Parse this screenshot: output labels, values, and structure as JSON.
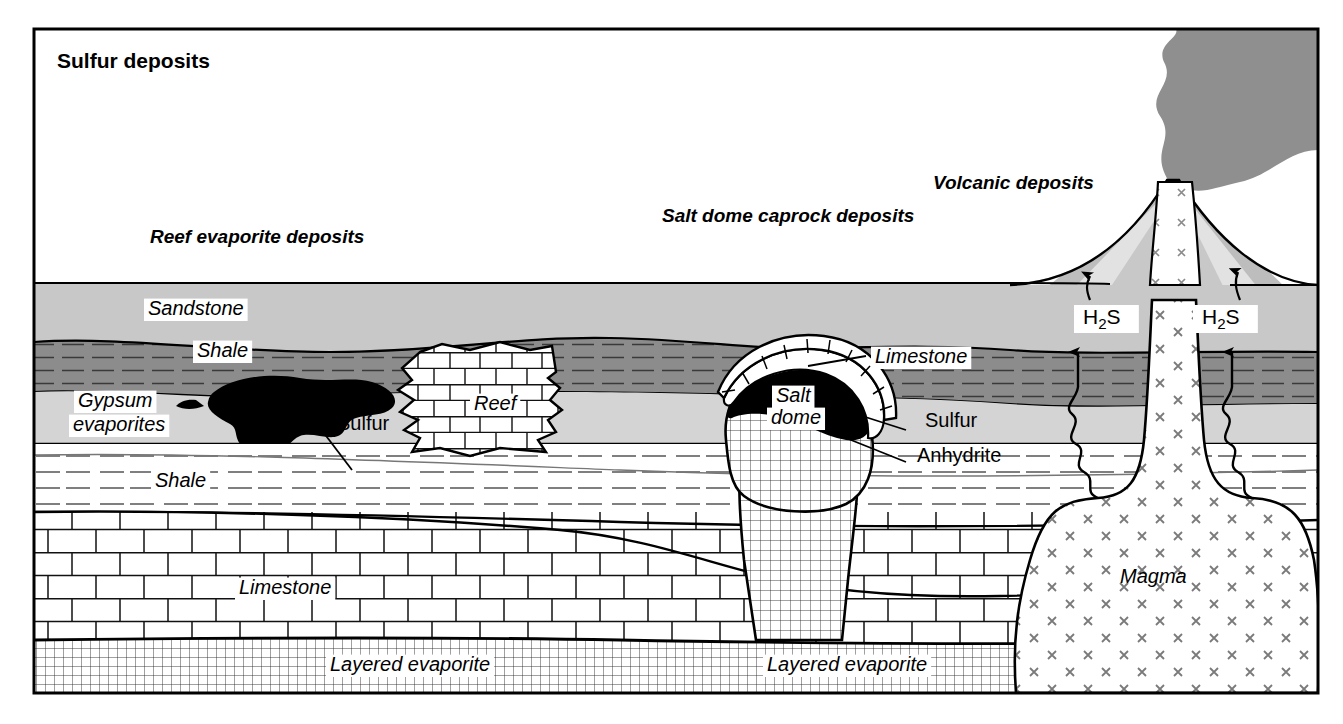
{
  "figure": {
    "title": "Sulfur deposits",
    "frame_color": "#000000",
    "background": "#ffffff"
  },
  "deposit_type_labels": [
    {
      "id": "reef",
      "text": "Reef evaporite deposits",
      "x": 150,
      "y": 243,
      "style": "italic"
    },
    {
      "id": "caprock",
      "text": "Salt dome caprock deposits",
      "x": 662,
      "y": 222,
      "style": "italic"
    },
    {
      "id": "volcanic",
      "text": "Volcanic deposits",
      "x": 933,
      "y": 189,
      "style": "italic"
    }
  ],
  "unit_labels": [
    {
      "id": "sandstone",
      "text": "Sandstone",
      "x": 148,
      "y": 315,
      "boxed": true,
      "style": "italic"
    },
    {
      "id": "shale-upper",
      "text": "Shale",
      "x": 197,
      "y": 357,
      "boxed": true,
      "style": "italic"
    },
    {
      "id": "gypsum-1",
      "text": "Gypsum",
      "x": 78,
      "y": 407,
      "boxed": true,
      "style": "italic"
    },
    {
      "id": "gypsum-2",
      "text": "evaporites",
      "x": 73,
      "y": 431,
      "boxed": true,
      "style": "italic"
    },
    {
      "id": "reef-unit",
      "text": "Reef",
      "x": 474,
      "y": 410,
      "boxed": true,
      "style": "italic"
    },
    {
      "id": "shale-deep",
      "text": "Shale",
      "x": 155,
      "y": 487,
      "boxed": true,
      "style": "italic"
    },
    {
      "id": "limestone-l",
      "text": "Limestone",
      "x": 239,
      "y": 594,
      "boxed": true,
      "style": "italic"
    },
    {
      "id": "saltdome-1",
      "text": "Salt",
      "x": 776,
      "y": 402,
      "boxed": true,
      "style": "italic"
    },
    {
      "id": "saltdome-2",
      "text": "dome",
      "x": 771,
      "y": 424,
      "boxed": true,
      "style": "italic"
    },
    {
      "id": "limestone-r",
      "text": "Limestone",
      "x": 875,
      "y": 363,
      "boxed": true,
      "style": "italic"
    },
    {
      "id": "evap-left",
      "text": "Layered evaporite",
      "x": 330,
      "y": 671,
      "boxed": true,
      "style": "italic"
    },
    {
      "id": "evap-right",
      "text": "Layered evaporite",
      "x": 767,
      "y": 671,
      "boxed": true,
      "style": "italic"
    },
    {
      "id": "magma",
      "text": "Magma",
      "x": 1120,
      "y": 583,
      "boxed": false,
      "style": "italic"
    }
  ],
  "callout_labels": [
    {
      "id": "sulfur-left",
      "text": "Sulfur",
      "x": 337,
      "y": 430,
      "style": "upright"
    },
    {
      "id": "sulfur-right",
      "text": "Sulfur",
      "x": 925,
      "y": 427,
      "style": "upright"
    },
    {
      "id": "anhydrite",
      "text": "Anhydrite",
      "x": 917,
      "y": 462,
      "style": "upright"
    }
  ],
  "gas_labels": [
    {
      "id": "h2s-left",
      "formula": "H",
      "sub": "2",
      "tail": "S",
      "x": 1083,
      "y": 324
    },
    {
      "id": "h2s-right",
      "formula": "H",
      "sub": "2",
      "tail": "S",
      "x": 1202,
      "y": 324
    }
  ],
  "colors": {
    "sandstone": "#c8c8c8",
    "shale": "#8c8c8c",
    "gypsum": "#d4d4d4",
    "smoke": "#8f8f8f",
    "cone_dark": "#9a9a9a",
    "cone_mid": "#bdbdbd",
    "cone_light": "#e2e2e2",
    "sulfur_black": "#000000",
    "white": "#ffffff",
    "line": "#000000",
    "pattern_gray": "#6e6e6e"
  },
  "patterns": {
    "shale_dashes": "dashed horizontal lines",
    "limestone_brick": "brick masonry",
    "evaporite_grid": "fine square grid",
    "magma_cross": "x symbols",
    "salt_grid": "fine square grid"
  }
}
